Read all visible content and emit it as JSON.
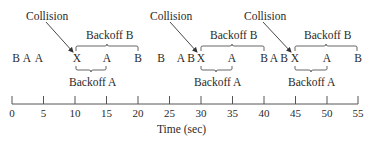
{
  "diagram": {
    "collision_label": "Collision",
    "backoff_b_label": "Backoff B",
    "backoff_a_label": "Backoff A",
    "axis_label": "Time (sec)",
    "axis_ticks": [
      "0",
      "5",
      "10",
      "15",
      "20",
      "25",
      "30",
      "35",
      "40",
      "45",
      "50",
      "55"
    ],
    "events": [
      {
        "label": "B",
        "time": 0.3
      },
      {
        "label": "A",
        "time": 2.0
      },
      {
        "label": "A",
        "time": 3.8
      },
      {
        "label": "X",
        "time": 10.2
      },
      {
        "label": "A",
        "time": 15.2
      },
      {
        "label": "B",
        "time": 20.0
      },
      {
        "label": "B",
        "time": 23.6
      },
      {
        "label": "A",
        "time": 26.8
      },
      {
        "label": "B",
        "time": 28.3
      },
      {
        "label": "X",
        "time": 30.0
      },
      {
        "label": "A",
        "time": 35.1
      },
      {
        "label": "B",
        "time": 40.1
      },
      {
        "label": "A",
        "time": 41.8
      },
      {
        "label": "B",
        "time": 43.4
      },
      {
        "label": "X",
        "time": 45.0
      },
      {
        "label": "A",
        "time": 50.3
      },
      {
        "label": "B",
        "time": 55.0
      }
    ],
    "collisions": [
      {
        "label": "Collision",
        "time": 10
      },
      {
        "label": "Collision",
        "time": 30
      },
      {
        "label": "Collision",
        "time": 45
      }
    ],
    "backoff_b": [
      [
        10,
        20
      ],
      [
        30,
        40
      ],
      [
        45,
        55
      ]
    ],
    "backoff_a": [
      [
        10,
        15
      ],
      [
        30,
        35
      ],
      [
        45,
        50
      ]
    ],
    "colors": {
      "ink": "#2a2a2a",
      "line": "#555555"
    }
  }
}
